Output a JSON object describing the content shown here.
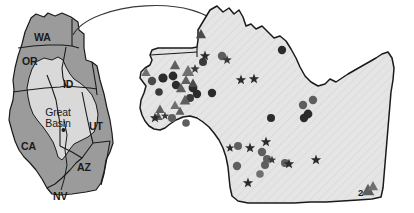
{
  "figure": {
    "type": "map",
    "background_color": "#ffffff"
  },
  "colors": {
    "state_fill": "#9b9b9b",
    "basin_fill": "#d9d9d9",
    "main_map_fill": "#e3e3e3",
    "outline": "#1a1a1a",
    "marker_dark": "#2b2b2b",
    "marker_mid": "#5e5e5e",
    "marker_gray": "#6f6f6f",
    "label_color": "#1a1a1a",
    "leader_line": "#3a3a3a"
  },
  "inset_map": {
    "name": "western-us-inset",
    "region_label": "Great Basin",
    "state_labels": [
      {
        "id": "WA",
        "text": "WA",
        "x": 34,
        "y": 37
      },
      {
        "id": "OR",
        "text": "OR",
        "x": 22,
        "y": 61
      },
      {
        "id": "ID",
        "text": "ID",
        "x": 62,
        "y": 84
      },
      {
        "id": "UT",
        "text": "UT",
        "x": 89,
        "y": 126
      },
      {
        "id": "CA",
        "text": "CA",
        "x": 21,
        "y": 146
      },
      {
        "id": "AZ",
        "text": "AZ",
        "x": 77,
        "y": 167
      },
      {
        "id": "NV",
        "text": "NV",
        "x": 53,
        "y": 194
      }
    ],
    "basin_label": {
      "text_line1": "Great",
      "text_line2": "Basin",
      "x": 32,
      "y": 113
    }
  },
  "main_map": {
    "name": "great-basin-detail-map",
    "legend_annotation": {
      "text": "2",
      "x": 360,
      "y": 193
    },
    "marker_counts": {
      "circles": 26,
      "triangles": 14,
      "stars": 14
    }
  },
  "chart_data": {
    "type": "scatter",
    "title": "",
    "xlabel": "",
    "ylabel": "",
    "legend": [
      {
        "symbol": "circle",
        "label": ""
      },
      {
        "symbol": "triangle",
        "label": ""
      },
      {
        "symbol": "star",
        "label": ""
      }
    ],
    "annotations": [
      {
        "text": "2",
        "x": 360,
        "y": 193,
        "note": "count label beside overlapping triangle pair"
      }
    ],
    "series": [
      {
        "name": "circle-localities",
        "symbol": "circle",
        "color": "#2b2b2b",
        "points": [
          {
            "x": 282,
            "y": 50,
            "r": 4.2,
            "shade": "#2b2b2b"
          },
          {
            "x": 222,
            "y": 56,
            "r": 4.2,
            "shade": "#5e5e5e"
          },
          {
            "x": 203,
            "y": 62,
            "r": 4.0,
            "shade": "#3a3a3a"
          },
          {
            "x": 152,
            "y": 81,
            "r": 4.2,
            "shade": "#4a4a4a"
          },
          {
            "x": 163,
            "y": 78,
            "r": 4.6,
            "shade": "#2b2b2b"
          },
          {
            "x": 173,
            "y": 76,
            "r": 4.4,
            "shade": "#2b2b2b"
          },
          {
            "x": 176,
            "y": 85,
            "r": 4.2,
            "shade": "#2b2b2b"
          },
          {
            "x": 159,
            "y": 92,
            "r": 3.8,
            "shade": "#3a3a3a"
          },
          {
            "x": 193,
            "y": 88,
            "r": 4.4,
            "shade": "#2b2b2b"
          },
          {
            "x": 197,
            "y": 94,
            "r": 4.2,
            "shade": "#2b2b2b"
          },
          {
            "x": 212,
            "y": 93,
            "r": 4.2,
            "shade": "#2b2b2b"
          },
          {
            "x": 190,
            "y": 98,
            "r": 4.0,
            "shade": "#3a3a3a"
          },
          {
            "x": 172,
            "y": 118,
            "r": 4.0,
            "shade": "#5e5e5e"
          },
          {
            "x": 303,
            "y": 105,
            "r": 4.2,
            "shade": "#5e5e5e"
          },
          {
            "x": 313,
            "y": 100,
            "r": 4.2,
            "shade": "#5e5e5e"
          },
          {
            "x": 308,
            "y": 114,
            "r": 4.4,
            "shade": "#2b2b2b"
          },
          {
            "x": 304,
            "y": 118,
            "r": 4.2,
            "shade": "#2b2b2b"
          },
          {
            "x": 271,
            "y": 118,
            "r": 4.0,
            "shade": "#2b2b2b"
          },
          {
            "x": 262,
            "y": 152,
            "r": 4.2,
            "shade": "#5e5e5e"
          },
          {
            "x": 267,
            "y": 159,
            "r": 4.0,
            "shade": "#5e5e5e"
          },
          {
            "x": 265,
            "y": 165,
            "r": 4.0,
            "shade": "#5e5e5e"
          },
          {
            "x": 285,
            "y": 163,
            "r": 4.0,
            "shade": "#5e5e5e"
          },
          {
            "x": 237,
            "y": 166,
            "r": 4.2,
            "shade": "#5e5e5e"
          },
          {
            "x": 260,
            "y": 174,
            "r": 3.8,
            "shade": "#6f6f6f"
          },
          {
            "x": 238,
            "y": 146,
            "r": 4.0,
            "shade": "#5e5e5e"
          },
          {
            "x": 186,
            "y": 123,
            "r": 3.8,
            "shade": "#5e5e5e"
          }
        ]
      },
      {
        "name": "triangle-localities",
        "symbol": "triangle",
        "color": "#5e5e5e",
        "points": [
          {
            "x": 201,
            "y": 34,
            "s": 5.0,
            "shade": "#4a4a4a"
          },
          {
            "x": 175,
            "y": 65,
            "s": 5.0,
            "shade": "#5e5e5e"
          },
          {
            "x": 146,
            "y": 72,
            "s": 4.6,
            "shade": "#6f6f6f"
          },
          {
            "x": 188,
            "y": 71,
            "s": 6.0,
            "shade": "#6f6f6f"
          },
          {
            "x": 186,
            "y": 80,
            "s": 4.8,
            "shade": "#5e5e5e"
          },
          {
            "x": 181,
            "y": 88,
            "s": 5.0,
            "shade": "#5e5e5e"
          },
          {
            "x": 193,
            "y": 83,
            "s": 4.6,
            "shade": "#4a4a4a"
          },
          {
            "x": 185,
            "y": 100,
            "s": 5.2,
            "shade": "#5e5e5e"
          },
          {
            "x": 175,
            "y": 105,
            "s": 4.6,
            "shade": "#6f6f6f"
          },
          {
            "x": 180,
            "y": 111,
            "s": 4.4,
            "shade": "#5e5e5e"
          },
          {
            "x": 160,
            "y": 109,
            "s": 4.6,
            "shade": "#5e5e5e"
          },
          {
            "x": 158,
            "y": 116,
            "s": 4.6,
            "shade": "#5e5e5e"
          },
          {
            "x": 368,
            "y": 190,
            "s": 6.2,
            "shade": "#5e5e5e"
          },
          {
            "x": 373,
            "y": 186,
            "s": 5.0,
            "shade": "#6f6f6f"
          }
        ]
      },
      {
        "name": "star-localities",
        "symbol": "star",
        "color": "#2b2b2b",
        "points": [
          {
            "x": 205,
            "y": 56,
            "s": 5.4,
            "shade": "#2b2b2b"
          },
          {
            "x": 227,
            "y": 60,
            "s": 5.0,
            "shade": "#3a3a3a"
          },
          {
            "x": 195,
            "y": 69,
            "s": 5.0,
            "shade": "#3a3a3a"
          },
          {
            "x": 241,
            "y": 80,
            "s": 5.4,
            "shade": "#2b2b2b"
          },
          {
            "x": 254,
            "y": 79,
            "s": 5.4,
            "shade": "#2b2b2b"
          },
          {
            "x": 155,
            "y": 118,
            "s": 5.4,
            "shade": "#2b2b2b"
          },
          {
            "x": 165,
            "y": 116,
            "s": 4.4,
            "shade": "#3a3a3a"
          },
          {
            "x": 250,
            "y": 148,
            "s": 5.4,
            "shade": "#2b2b2b"
          },
          {
            "x": 266,
            "y": 142,
            "s": 5.4,
            "shade": "#2b2b2b"
          },
          {
            "x": 289,
            "y": 164,
            "s": 5.4,
            "shade": "#2b2b2b"
          },
          {
            "x": 316,
            "y": 160,
            "s": 5.4,
            "shade": "#2b2b2b"
          },
          {
            "x": 248,
            "y": 183,
            "s": 5.4,
            "shade": "#2b2b2b"
          },
          {
            "x": 230,
            "y": 148,
            "s": 4.6,
            "shade": "#2b2b2b"
          },
          {
            "x": 272,
            "y": 160,
            "s": 4.4,
            "shade": "#3a3a3a"
          }
        ]
      }
    ]
  }
}
